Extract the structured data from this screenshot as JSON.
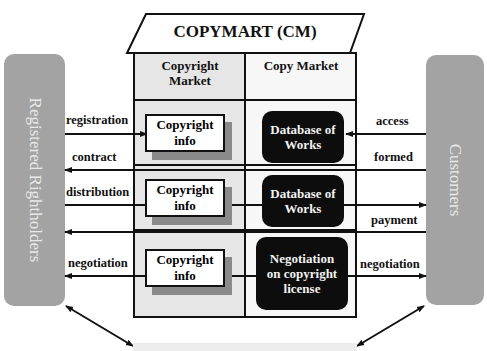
{
  "title": "COPYMART (CM)",
  "columns": {
    "left": "Copyright Market",
    "right": "Copy Market"
  },
  "left_entity": "Registered Rightholders",
  "right_entity": "Customers",
  "rows": [
    {
      "left_box": "Copyright info",
      "right_box": "Database of Works",
      "left_labels": [
        "registration",
        "contract"
      ],
      "right_labels": [
        "access",
        "formed"
      ]
    },
    {
      "left_box": "Copyright info",
      "right_box": "Database of Works",
      "left_labels": [
        "distribution"
      ],
      "right_labels": [
        "payment"
      ]
    },
    {
      "left_box": "Copyright info",
      "right_box": "Negotiation on copyright license",
      "left_labels": [
        "negotiation"
      ],
      "right_labels": [
        "negotiation"
      ]
    }
  ],
  "colors": {
    "side_panels": "#a3a3a3",
    "left_column_bg": "#e6e6e6",
    "dark_box": "#0d0d0d",
    "box_shadow": "#8a8a8a"
  }
}
